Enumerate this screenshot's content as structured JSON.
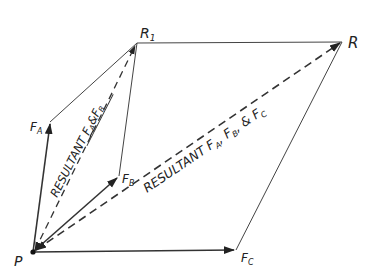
{
  "diagram": {
    "type": "vector-force-polygon",
    "colors": {
      "line": "#333333",
      "background": "#ffffff"
    },
    "points": {
      "P": {
        "label": "P",
        "x": 33,
        "y": 252
      },
      "FA": {
        "label": "F",
        "sub": "A",
        "x": 50,
        "y": 122
      },
      "FB": {
        "label": "F",
        "sub": "B",
        "x": 119,
        "y": 176
      },
      "FC": {
        "label": "F",
        "sub": "C",
        "x": 236,
        "y": 250
      },
      "R1": {
        "label": "R",
        "sub": "1",
        "x": 137,
        "y": 43
      },
      "R": {
        "label": "R",
        "x": 342,
        "y": 42
      }
    },
    "labels": {
      "P": "P",
      "R": "R",
      "R1_main": "R",
      "R1_sub": "1",
      "FA_main": "F",
      "FA_sub": "A",
      "FB_main": "F",
      "FB_sub": "B",
      "FC_main": "F",
      "FC_sub": "C",
      "resultant_ab_prefix": "RESULTANT ",
      "resultant_ab_f1": "F",
      "resultant_ab_s1": "A",
      "resultant_ab_amp": "&",
      "resultant_ab_f2": "F",
      "resultant_ab_s2": "B",
      "resultant_abc_prefix": "RESULTANT ",
      "resultant_abc_f1": "F",
      "resultant_abc_s1": "A",
      "resultant_abc_sep1": ", ",
      "resultant_abc_f2": "F",
      "resultant_abc_s2": "B",
      "resultant_abc_sep2": ", ",
      "resultant_abc_amp": "& ",
      "resultant_abc_f3": "F",
      "resultant_abc_s3": "C"
    }
  }
}
